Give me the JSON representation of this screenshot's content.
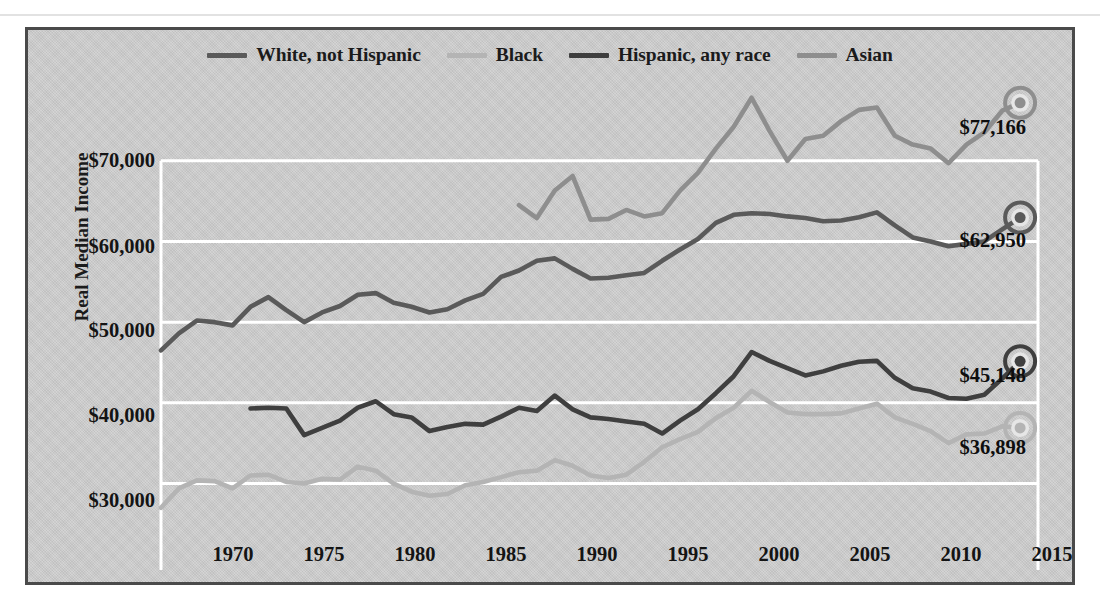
{
  "figure": {
    "background_color": "#cfcfcf",
    "border_color": "#4a4a4a",
    "gridline_color": "#ffffff"
  },
  "legend": {
    "position": "top-center",
    "items": [
      {
        "label": "White, not Hispanic",
        "color": "#5a5a5a",
        "swatch_name": "legend-swatch-white-not-hispanic"
      },
      {
        "label": "Black",
        "color": "#b4b4b4",
        "swatch_name": "legend-swatch-black"
      },
      {
        "label": "Hispanic, any race",
        "color": "#3f3f3f",
        "swatch_name": "legend-swatch-hispanic"
      },
      {
        "label": "Asian",
        "color": "#8e8e8e",
        "swatch_name": "legend-swatch-asian"
      }
    ]
  },
  "axes": {
    "y_title": "Real Median Income",
    "y_ticks": [
      "$30,000",
      "$40,000",
      "$50,000",
      "$60,000",
      "$70,000"
    ],
    "y_tick_values": [
      30000,
      40000,
      50000,
      60000,
      70000
    ],
    "ylim": [
      24000,
      80000
    ],
    "x_ticks": [
      "1970",
      "1975",
      "1980",
      "1985",
      "1990",
      "1995",
      "2000",
      "2005",
      "2010",
      "2015"
    ],
    "x_tick_values": [
      1970,
      1975,
      1980,
      1985,
      1990,
      1995,
      2000,
      2005,
      2010,
      2015
    ],
    "xlim": [
      1967,
      2016
    ]
  },
  "end_labels": [
    {
      "series": "Asian",
      "text": "$77,166",
      "value": 77166,
      "year": 2015,
      "color": "#8e8e8e"
    },
    {
      "series": "White, not Hispanic",
      "text": "$62,950",
      "value": 62950,
      "year": 2015,
      "color": "#5a5a5a"
    },
    {
      "series": "Hispanic, any race",
      "text": "$45,148",
      "value": 45148,
      "year": 2015,
      "color": "#3f3f3f"
    },
    {
      "series": "Black",
      "text": "$36,898",
      "value": 36898,
      "year": 2015,
      "color": "#b4b4b4"
    }
  ],
  "chart_data": {
    "type": "line",
    "title": "",
    "subtitle": "",
    "xlabel": "",
    "ylabel": "Real Median Income",
    "xlim": [
      1967,
      2016
    ],
    "ylim": [
      24000,
      80000
    ],
    "grid": true,
    "grid_axis": "y",
    "legend_position": "top-center",
    "y_tick_labels": [
      "$30,000",
      "$40,000",
      "$50,000",
      "$60,000",
      "$70,000"
    ],
    "x_tick_labels": [
      "1970",
      "1975",
      "1980",
      "1985",
      "1990",
      "1995",
      "2000",
      "2005",
      "2010",
      "2015"
    ],
    "annotations": [
      "$77,166",
      "$62,950",
      "$45,148",
      "$36,898"
    ],
    "series": [
      {
        "name": "White, not Hispanic",
        "color": "#5a5a5a",
        "end_marker": true,
        "end_value": 62950,
        "x": [
          1967,
          1968,
          1969,
          1970,
          1971,
          1972,
          1973,
          1974,
          1975,
          1976,
          1977,
          1978,
          1979,
          1980,
          1981,
          1982,
          1983,
          1984,
          1985,
          1986,
          1987,
          1988,
          1989,
          1990,
          1991,
          1992,
          1993,
          1994,
          1995,
          1996,
          1997,
          1998,
          1999,
          2000,
          2001,
          2002,
          2003,
          2004,
          2005,
          2006,
          2007,
          2008,
          2009,
          2010,
          2011,
          2012,
          2013,
          2014,
          2015
        ],
        "y": [
          46500,
          48600,
          50200,
          50000,
          49600,
          51900,
          53100,
          51500,
          50000,
          51200,
          52000,
          53400,
          53600,
          52400,
          51900,
          51200,
          51600,
          52700,
          53500,
          55600,
          56400,
          57600,
          57900,
          56600,
          55400,
          55500,
          55800,
          56100,
          57600,
          59000,
          60300,
          62300,
          63300,
          63500,
          63400,
          63100,
          62900,
          62500,
          62600,
          63000,
          63600,
          62000,
          60500,
          60000,
          59400,
          59700,
          60000,
          61500,
          62950
        ]
      },
      {
        "name": "Black",
        "color": "#b4b4b4",
        "end_marker": true,
        "end_value": 36898,
        "x": [
          1967,
          1968,
          1969,
          1970,
          1971,
          1972,
          1973,
          1974,
          1975,
          1976,
          1977,
          1978,
          1979,
          1980,
          1981,
          1982,
          1983,
          1984,
          1985,
          1986,
          1987,
          1988,
          1989,
          1990,
          1991,
          1992,
          1993,
          1994,
          1995,
          1996,
          1997,
          1998,
          1999,
          2000,
          2001,
          2002,
          2003,
          2004,
          2005,
          2006,
          2007,
          2008,
          2009,
          2010,
          2011,
          2012,
          2013,
          2014,
          2015
        ],
        "y": [
          27000,
          29400,
          30400,
          30300,
          29400,
          31000,
          31100,
          30200,
          30000,
          30600,
          30500,
          32100,
          31600,
          30000,
          29000,
          28500,
          28700,
          29800,
          30200,
          30800,
          31400,
          31600,
          32900,
          32200,
          31000,
          30700,
          31100,
          32700,
          34500,
          35500,
          36400,
          38100,
          39400,
          41500,
          40100,
          38800,
          38600,
          38600,
          38700,
          39300,
          39900,
          38200,
          37400,
          36500,
          35000,
          36100,
          36200,
          37100,
          36898
        ]
      },
      {
        "name": "Hispanic, any race",
        "color": "#3f3f3f",
        "end_marker": true,
        "end_value": 45148,
        "x": [
          1972,
          1973,
          1974,
          1975,
          1976,
          1977,
          1978,
          1979,
          1980,
          1981,
          1982,
          1983,
          1984,
          1985,
          1986,
          1987,
          1988,
          1989,
          1990,
          1991,
          1992,
          1993,
          1994,
          1995,
          1996,
          1997,
          1998,
          1999,
          2000,
          2001,
          2002,
          2003,
          2004,
          2005,
          2006,
          2007,
          2008,
          2009,
          2010,
          2011,
          2012,
          2013,
          2014,
          2015
        ],
        "y": [
          39300,
          39400,
          39300,
          36000,
          36900,
          37800,
          39400,
          40200,
          38600,
          38200,
          36500,
          37000,
          37400,
          37300,
          38300,
          39400,
          39000,
          40900,
          39200,
          38200,
          38000,
          37700,
          37400,
          36200,
          37800,
          39200,
          41200,
          43300,
          46300,
          45200,
          44300,
          43400,
          43900,
          44600,
          45100,
          45200,
          43100,
          41800,
          41400,
          40600,
          40500,
          41000,
          43000,
          45148
        ]
      },
      {
        "name": "Asian",
        "color": "#8e8e8e",
        "end_marker": true,
        "end_value": 77166,
        "x": [
          1987,
          1988,
          1989,
          1990,
          1991,
          1992,
          1993,
          1994,
          1995,
          1996,
          1997,
          1998,
          1999,
          2000,
          2001,
          2002,
          2003,
          2004,
          2005,
          2006,
          2007,
          2008,
          2009,
          2010,
          2011,
          2012,
          2013,
          2014,
          2015
        ],
        "y": [
          64500,
          62900,
          66300,
          68100,
          62700,
          62800,
          63900,
          63100,
          63500,
          66300,
          68500,
          71500,
          74200,
          77800,
          73700,
          70000,
          72700,
          73100,
          74900,
          76300,
          76600,
          73100,
          72000,
          71500,
          69700,
          72000,
          73500,
          76200,
          77166
        ]
      }
    ]
  }
}
